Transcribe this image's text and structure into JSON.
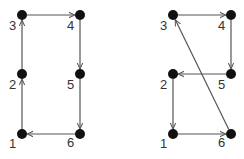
{
  "diagrams": [
    {
      "name": "left-cycle",
      "nodes": [
        {
          "id": "1",
          "x": 22,
          "y": 134,
          "lx": 9,
          "ly": 137
        },
        {
          "id": "2",
          "x": 22,
          "y": 74,
          "lx": 9,
          "ly": 78
        },
        {
          "id": "3",
          "x": 22,
          "y": 15,
          "lx": 9,
          "ly": 19
        },
        {
          "id": "4",
          "x": 80,
          "y": 15,
          "lx": 67,
          "ly": 19
        },
        {
          "id": "5",
          "x": 80,
          "y": 74,
          "lx": 67,
          "ly": 78
        },
        {
          "id": "6",
          "x": 80,
          "y": 134,
          "lx": 67,
          "ly": 136
        }
      ],
      "edges": [
        [
          "1",
          "2"
        ],
        [
          "2",
          "3"
        ],
        [
          "3",
          "4"
        ],
        [
          "4",
          "5"
        ],
        [
          "5",
          "6"
        ],
        [
          "6",
          "1"
        ]
      ]
    },
    {
      "name": "right-cycle",
      "nodes": [
        {
          "id": "1",
          "x": 173,
          "y": 134,
          "lx": 160,
          "ly": 137
        },
        {
          "id": "2",
          "x": 173,
          "y": 74,
          "lx": 160,
          "ly": 78
        },
        {
          "id": "3",
          "x": 173,
          "y": 15,
          "lx": 160,
          "ly": 19
        },
        {
          "id": "4",
          "x": 231,
          "y": 15,
          "lx": 218,
          "ly": 19
        },
        {
          "id": "5",
          "x": 231,
          "y": 74,
          "lx": 218,
          "ly": 78
        },
        {
          "id": "6",
          "x": 231,
          "y": 134,
          "lx": 218,
          "ly": 136
        }
      ],
      "edges": [
        [
          "3",
          "4"
        ],
        [
          "4",
          "5"
        ],
        [
          "5",
          "2"
        ],
        [
          "2",
          "1"
        ],
        [
          "1",
          "6"
        ],
        [
          "6",
          "3"
        ]
      ]
    }
  ],
  "colors": {
    "node": "#111111",
    "edge": "#555555",
    "label": "#333333"
  }
}
